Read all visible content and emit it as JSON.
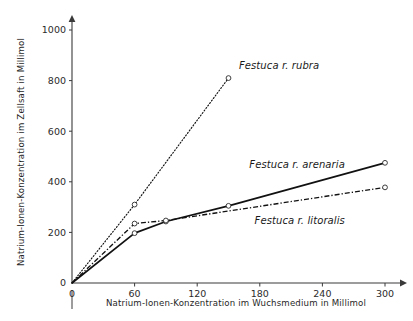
{
  "chart_data": {
    "type": "line",
    "title": "",
    "xlabel": "Natrium-Ionen-Konzentration im Wuchsmedium in Millimol",
    "ylabel": "Natrium-Ionen-Konzentration im Zellsaft in Millimol",
    "xlim": [
      0,
      310
    ],
    "ylim": [
      0,
      1040
    ],
    "xticks": [
      0,
      60,
      120,
      180,
      240,
      300
    ],
    "xtick_labels": [
      "0",
      "60",
      "120",
      "180",
      "240",
      "300"
    ],
    "yticks": [
      0,
      200,
      400,
      600,
      800,
      1000
    ],
    "ytick_labels": [
      "0",
      "200",
      "400",
      "600",
      "800",
      "1000"
    ],
    "grid": false,
    "legend_position": "inline-annotations",
    "series": [
      {
        "name": "Festuca r. rubra",
        "style": "dotted",
        "marker": "open-circle",
        "x": [
          0,
          60,
          150
        ],
        "values": [
          0,
          310,
          810
        ],
        "label_x": 160,
        "label_y": 845
      },
      {
        "name": "Festuca r. arenaria",
        "style": "solid",
        "marker": "open-circle",
        "x": [
          0,
          60,
          90,
          150,
          300
        ],
        "values": [
          0,
          197,
          243,
          305,
          475
        ],
        "label_x": 170,
        "label_y": 455
      },
      {
        "name": "Festuca r. litoralis",
        "style": "dash-dot",
        "marker": "open-circle",
        "x": [
          0,
          60,
          90,
          300
        ],
        "values": [
          0,
          235,
          247,
          378
        ],
        "label_x": 175,
        "label_y": 232
      }
    ]
  },
  "axes": {
    "x_axis_name": "x-axis",
    "y_axis_name": "y-axis"
  }
}
